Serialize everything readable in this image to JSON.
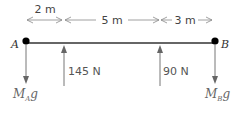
{
  "diagram": {
    "dimensions": [
      {
        "label": "2 m"
      },
      {
        "label": "5 m"
      },
      {
        "label": "3 m"
      }
    ],
    "points": {
      "A": {
        "label": "A"
      },
      "B": {
        "label": "B"
      }
    },
    "forces": [
      {
        "label": "145 N",
        "direction": "up"
      },
      {
        "label": "90 N",
        "direction": "up"
      }
    ],
    "weights": [
      {
        "base": "M",
        "sub": "A",
        "tail": "g",
        "direction": "down"
      },
      {
        "base": "M",
        "sub": "B",
        "tail": "g",
        "direction": "down"
      }
    ],
    "colors": {
      "beam": "#333333",
      "arrow": "#777777",
      "dim_arrow": "#888888",
      "point": "#000000"
    }
  }
}
